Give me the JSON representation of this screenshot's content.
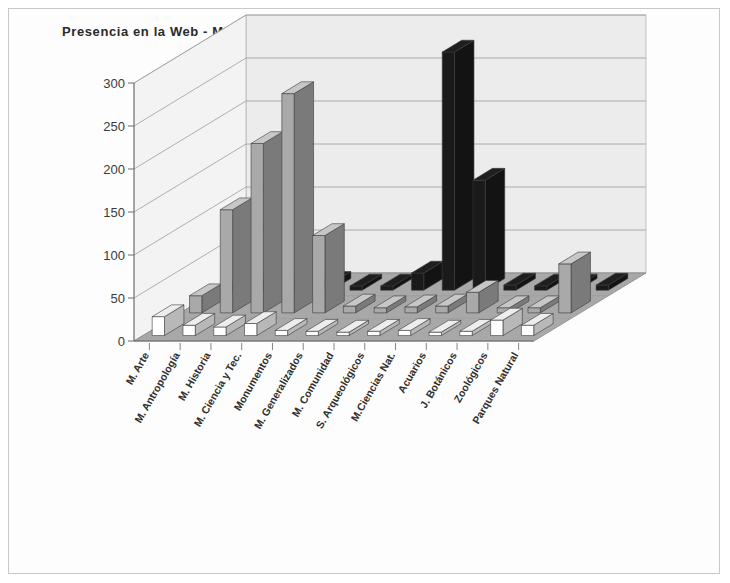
{
  "chart": {
    "title": "Presencia en la Web - Mexico"
  },
  "legend": {
    "items": [
      {
        "label": "Web",
        "swatch": "white-square-icon",
        "color": "#ffffff"
      },
      {
        "label": "Link",
        "swatch": "gray-square-icon",
        "color": "#a9a9a9"
      },
      {
        "label": "Institución",
        "swatch": "black-square-icon",
        "color": "#1a1a1a"
      }
    ]
  },
  "axis": {
    "y_ticks": [
      "0",
      "50",
      "100",
      "150",
      "200",
      "250",
      "300"
    ]
  },
  "chart_data": {
    "type": "bar",
    "title": "Presencia en la Web - Mexico",
    "xlabel": "",
    "ylabel": "",
    "ylim": [
      0,
      300
    ],
    "ytick_step": 50,
    "grid": true,
    "legend_position": "top-right",
    "projection": "3d-isometric",
    "categories": [
      "M. Arte",
      "M. Antropología",
      "M. Historia",
      "M. Ciencia y Tec.",
      "Monumentos",
      "M. Generalizados",
      "M. Comunidad",
      "S. Arqueológicos",
      "M.Ciencias Nat.",
      "Acuarios",
      "J. Botánicos",
      "Zoológicos",
      "Parques Natural"
    ],
    "series": [
      {
        "name": "Web",
        "color": "#ffffff",
        "values": [
          22,
          12,
          10,
          14,
          6,
          5,
          4,
          5,
          6,
          4,
          5,
          18,
          12
        ]
      },
      {
        "name": "Link",
        "color": "#a9a9a9",
        "values": [
          20,
          120,
          197,
          255,
          90,
          8,
          6,
          7,
          8,
          24,
          6,
          6,
          57
        ]
      },
      {
        "name": "Institución",
        "color": "#1a1a1a",
        "values": [
          5,
          6,
          6,
          8,
          5,
          5,
          20,
          277,
          128,
          6,
          5,
          5,
          6
        ]
      }
    ]
  },
  "colors": {
    "floor": "#a8a8a8",
    "wall": "#ececec",
    "gridline": "#9d9d9d",
    "frame": "#c9c9c9"
  }
}
